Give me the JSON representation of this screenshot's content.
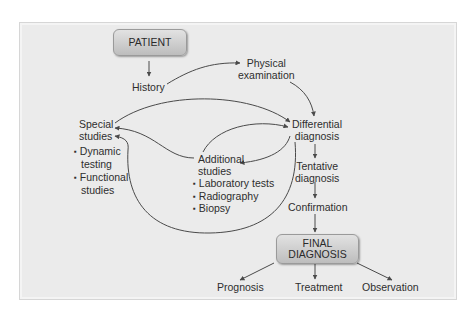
{
  "diagram": {
    "type": "flowchart",
    "title": "",
    "colors": {
      "panel_background": "#ebebeb",
      "box_fill": "#cfcfcf",
      "line": "#4a4a4a",
      "text": "#2e2e2e"
    },
    "nodes": {
      "patient": {
        "label": "PATIENT"
      },
      "history": {
        "label": "History"
      },
      "physical_examination": {
        "line1": "Physical",
        "line2": "examination"
      },
      "special_studies": {
        "line1": "Special",
        "line2": "studies",
        "items": [
          {
            "line1": "Dynamic",
            "line2": "testing"
          },
          {
            "line1": "Functional",
            "line2": "studies"
          }
        ]
      },
      "differential_diagnosis": {
        "line1": "Differential",
        "line2": "diagnosis"
      },
      "additional_studies": {
        "line1": "Additional",
        "line2": "studies",
        "items": [
          "Laboratory tests",
          "Radiography",
          "Biopsy"
        ]
      },
      "tentative_diagnosis": {
        "line1": "Tentative",
        "line2": "diagnosis"
      },
      "confirmation": {
        "label": "Confirmation"
      },
      "final_diagnosis": {
        "line1": "FINAL",
        "line2": "DIAGNOSIS"
      },
      "prognosis": {
        "label": "Prognosis"
      },
      "treatment": {
        "label": "Treatment"
      },
      "observation": {
        "label": "Observation"
      }
    },
    "edges": [
      {
        "from": "PATIENT",
        "to": "History"
      },
      {
        "from": "History",
        "to": "Physical examination"
      },
      {
        "from": "Physical examination",
        "to": "Differential diagnosis"
      },
      {
        "from": "Special studies",
        "to": "Differential diagnosis"
      },
      {
        "from": "Additional studies",
        "to": "Differential diagnosis"
      },
      {
        "from": "Differential diagnosis",
        "to": "Additional studies"
      },
      {
        "from": "Additional studies",
        "to": "Special studies"
      },
      {
        "from": "Differential diagnosis",
        "to": "Special studies"
      },
      {
        "from": "Differential diagnosis",
        "to": "Tentative diagnosis"
      },
      {
        "from": "Tentative diagnosis",
        "to": "Confirmation"
      },
      {
        "from": "Confirmation",
        "to": "FINAL DIAGNOSIS"
      },
      {
        "from": "FINAL DIAGNOSIS",
        "to": "Prognosis"
      },
      {
        "from": "FINAL DIAGNOSIS",
        "to": "Treatment"
      },
      {
        "from": "FINAL DIAGNOSIS",
        "to": "Observation"
      }
    ]
  }
}
